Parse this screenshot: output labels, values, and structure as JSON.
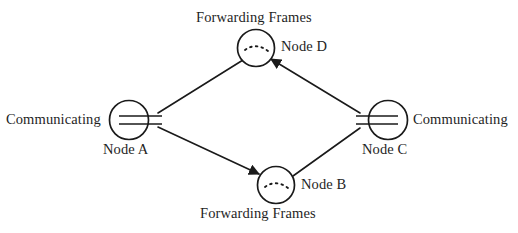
{
  "figure": {
    "type": "network-topology-diagram",
    "background_color": "#ffffff",
    "stroke_color": "#1a1a1a"
  },
  "labels": {
    "communicating_left": "Communicating",
    "communicating_right": "Communicating",
    "forwarding_top": "Forwarding Frames",
    "forwarding_bottom": "Forwarding Frames",
    "node_a": "Node A",
    "node_b": "Node B",
    "node_c": "Node C",
    "node_d": "Node D"
  },
  "nodes": [
    {
      "id": "A",
      "label": "Node A",
      "role": "Communicating",
      "cx": 129,
      "cy": 120,
      "r": 19,
      "marker": "double-line"
    },
    {
      "id": "D",
      "label": "Node D",
      "role": "Forwarding Frames",
      "cx": 256,
      "cy": 48,
      "r": 18,
      "marker": "dashed-arc"
    },
    {
      "id": "C",
      "label": "Node C",
      "role": "Communicating",
      "cx": 388,
      "cy": 120,
      "r": 19,
      "marker": "double-line"
    },
    {
      "id": "B",
      "label": "Node B",
      "role": "Forwarding Frames",
      "cx": 276,
      "cy": 185,
      "r": 18,
      "marker": "dashed-arc"
    }
  ],
  "links": [
    {
      "from": "A",
      "to": "D",
      "arrow": false
    },
    {
      "from": "A",
      "to": "B",
      "arrow": true
    },
    {
      "from": "C",
      "to": "D",
      "arrow": true
    },
    {
      "from": "B",
      "to": "C",
      "arrow": false
    }
  ]
}
